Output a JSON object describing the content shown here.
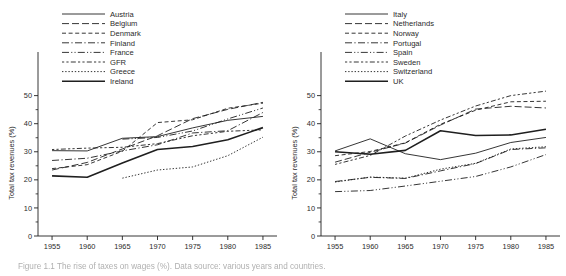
{
  "figure": {
    "caption": "Figure 1.1  The rise of taxes on wages (%). Data source: various years and countries.",
    "axis_label_y": "Total tax revenues (%)",
    "y_ticks": [
      0,
      10,
      20,
      30,
      40,
      50
    ],
    "y_minor_ticks": [
      5,
      15,
      25,
      35,
      45
    ],
    "x_ticks": [
      1955,
      1960,
      1965,
      1970,
      1975,
      1980,
      1985
    ],
    "ylim": [
      0,
      52
    ],
    "xlim": [
      1953,
      1987
    ],
    "line_color": "#1f1f1f"
  },
  "chart_data": [
    {
      "type": "line",
      "panel": "left",
      "title": "",
      "xlabel": "",
      "ylabel": "Total tax revenues (%)",
      "xlim": [
        1953,
        1987
      ],
      "ylim": [
        0,
        52
      ],
      "grid": false,
      "legend_position": "top-center",
      "x": [
        1955,
        1960,
        1965,
        1970,
        1975,
        1980,
        1985
      ],
      "series": [
        {
          "name": "Austria",
          "dash": "solid",
          "width": 0.9,
          "values": [
            30.4,
            30.3,
            34.8,
            35.4,
            38.5,
            41.2,
            42.6
          ]
        },
        {
          "name": "Belgium",
          "dash": "long-dash",
          "width": 0.9,
          "values": [
            23.5,
            26.2,
            31.0,
            35.7,
            41.8,
            45.1,
            47.6
          ]
        },
        {
          "name": "Denmark",
          "dash": "short-dash",
          "width": 0.9,
          "values": [
            24.0,
            25.4,
            30.2,
            40.4,
            41.4,
            45.5,
            47.3
          ]
        },
        {
          "name": "Finland",
          "dash": "dash-dot",
          "width": 0.9,
          "values": [
            26.9,
            27.7,
            30.3,
            32.5,
            36.7,
            37.5,
            44.0
          ]
        },
        {
          "name": "France",
          "dash": "dash-dot-dot",
          "width": 0.9,
          "values": [
            null,
            null,
            34.5,
            35.1,
            37.4,
            41.7,
            45.6
          ]
        },
        {
          "name": "GFR",
          "dash": "dot-dash",
          "width": 0.9,
          "values": [
            30.8,
            31.3,
            31.6,
            32.9,
            35.7,
            37.3,
            37.8
          ]
        },
        {
          "name": "Greece",
          "dash": "dotted",
          "width": 0.9,
          "values": [
            null,
            null,
            20.6,
            23.5,
            24.6,
            28.6,
            35.2
          ]
        },
        {
          "name": "Ireland",
          "dash": "solid-thick",
          "width": 1.6,
          "values": [
            21.4,
            20.9,
            26.0,
            30.8,
            31.9,
            34.3,
            38.6
          ]
        }
      ]
    },
    {
      "type": "line",
      "panel": "right",
      "title": "",
      "xlabel": "",
      "ylabel": "Total tax revenues (%)",
      "xlim": [
        1953,
        1987
      ],
      "ylim": [
        0,
        52
      ],
      "grid": false,
      "legend_position": "top-center",
      "x": [
        1955,
        1960,
        1965,
        1970,
        1975,
        1980,
        1985
      ],
      "series": [
        {
          "name": "Italy",
          "dash": "solid",
          "width": 0.9,
          "values": [
            30.3,
            34.6,
            29.3,
            27.2,
            29.5,
            33.3,
            35.1
          ]
        },
        {
          "name": "Netherlands",
          "dash": "long-dash",
          "width": 0.9,
          "values": [
            26.3,
            29.8,
            33.1,
            39.5,
            45.2,
            46.2,
            45.6
          ]
        },
        {
          "name": "Norway",
          "dash": "short-dash",
          "width": 0.9,
          "values": [
            28.6,
            30.1,
            33.2,
            39.8,
            44.8,
            47.8,
            48.0
          ]
        },
        {
          "name": "Portugal",
          "dash": "dash-dot",
          "width": 0.9,
          "values": [
            19.4,
            20.9,
            20.5,
            23.2,
            25.8,
            30.8,
            31.4
          ]
        },
        {
          "name": "Spain",
          "dash": "dash-dot-dot",
          "width": 0.9,
          "values": [
            15.8,
            16.2,
            17.8,
            19.5,
            21.2,
            24.6,
            29.0
          ]
        },
        {
          "name": "Sweden",
          "dash": "dot-dash",
          "width": 0.9,
          "values": [
            25.5,
            28.7,
            35.6,
            41.3,
            46.3,
            50.0,
            51.6
          ]
        },
        {
          "name": "Switzerland",
          "dash": "dotted",
          "width": 0.9,
          "values": [
            19.2,
            21.0,
            20.6,
            23.8,
            25.9,
            31.0,
            31.8
          ]
        },
        {
          "name": "UK",
          "dash": "solid-thick",
          "width": 1.6,
          "values": [
            30.0,
            29.1,
            30.5,
            37.5,
            35.8,
            36.0,
            38.0
          ]
        }
      ]
    }
  ]
}
